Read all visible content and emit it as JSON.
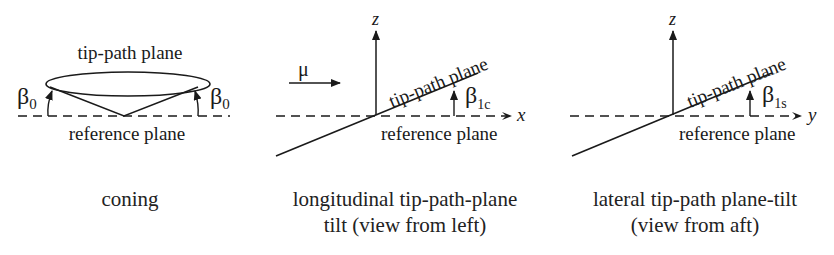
{
  "panels": [
    {
      "id": "coning",
      "plane_top": "tip-path plane",
      "plane_bottom": "reference plane",
      "angle_left": "β",
      "angle_left_sub": "0",
      "angle_right": "β",
      "angle_right_sub": "0",
      "caption": [
        "coning"
      ]
    },
    {
      "id": "longitudinal",
      "axis_vertical": "z",
      "axis_horizontal": "x",
      "velocity": "μ",
      "plane_top": "tip-path plane",
      "plane_bottom": "reference plane",
      "angle": "β",
      "angle_sub": "1c",
      "caption": [
        "longitudinal tip-path-plane",
        "tilt (view from left)"
      ]
    },
    {
      "id": "lateral",
      "axis_vertical": "z",
      "axis_horizontal": "y",
      "plane_top": "tip-path plane",
      "plane_bottom": "reference plane",
      "angle": "β",
      "angle_sub": "1s",
      "caption": [
        "lateral tip-path plane-tilt",
        "(view from aft)"
      ]
    }
  ]
}
